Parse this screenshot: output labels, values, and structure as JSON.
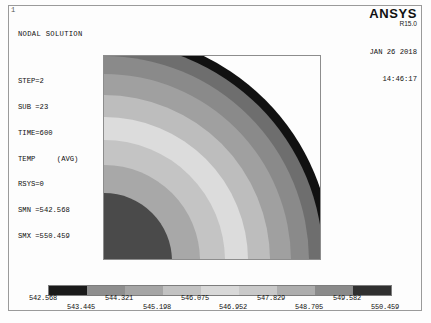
{
  "window": {
    "index_label": "1"
  },
  "header": {
    "title": "NODAL SOLUTION",
    "lines": [
      "STEP=2",
      "SUB =23",
      "TIME=600",
      "TEMP     (AVG)",
      "RSYS=0",
      "SMN =542.568",
      "SMX =550.459"
    ],
    "step": "STEP=2",
    "sub": "SUB =23",
    "time": "TIME=600",
    "quantity": "TEMP     (AVG)",
    "rsys": "RSYS=0",
    "smn": "SMN =542.568",
    "smx": "SMX =550.459"
  },
  "brand": {
    "name": "ANSYS",
    "release": "R15.0"
  },
  "timestamp": {
    "date": "JAN 26 2018",
    "time": "14:46:17"
  },
  "plot": {
    "min_marker": "MN",
    "max_marker": "MX"
  },
  "chart_data": {
    "type": "heatmap",
    "title": "NODAL SOLUTION",
    "quantity": "TEMP (AVG)",
    "units_note": "",
    "xlabel": "",
    "ylabel": "",
    "smn": 542.568,
    "smx": 550.459,
    "band_count": 9,
    "tick_labels": [
      "542.568",
      "543.445",
      "544.321",
      "545.198",
      "546.075",
      "546.952",
      "547.829",
      "548.705",
      "549.582",
      "550.459"
    ],
    "tick_values": [
      542.568,
      543.445,
      544.321,
      545.198,
      546.075,
      546.952,
      547.829,
      548.705,
      549.582,
      550.459
    ],
    "band_ranges": [
      [
        542.568,
        543.445
      ],
      [
        543.445,
        544.321
      ],
      [
        544.321,
        545.198
      ],
      [
        545.198,
        546.075
      ],
      [
        546.075,
        546.952
      ],
      [
        546.952,
        547.829
      ],
      [
        547.829,
        548.705
      ],
      [
        548.705,
        549.582
      ],
      [
        549.582,
        550.459
      ]
    ],
    "band_colors": [
      "#1a1a1a",
      "#8e8e8e",
      "#a5a5a5",
      "#c2c2c2",
      "#d8d8d8",
      "#c9c9c9",
      "#adadad",
      "#8a8a8a",
      "#303030"
    ],
    "legend_position": "bottom",
    "grid": false,
    "geometry": "quarter-annulus, concentric bands centred at lower-left origin",
    "radial_bands": [
      {
        "index": 0,
        "value_range": [
          542.568,
          543.445
        ],
        "color": "#4a4a4a",
        "outer_radius_pct": 30
      },
      {
        "index": 1,
        "value_range": [
          543.445,
          544.321
        ],
        "color": "#a8a8a8",
        "outer_radius_pct": 42
      },
      {
        "index": 2,
        "value_range": [
          544.321,
          545.198
        ],
        "color": "#c4c4c4",
        "outer_radius_pct": 53
      },
      {
        "index": 3,
        "value_range": [
          545.198,
          546.075
        ],
        "color": "#dcdcdc",
        "outer_radius_pct": 63
      },
      {
        "index": 4,
        "value_range": [
          546.075,
          546.952
        ],
        "color": "#bdbdbd",
        "outer_radius_pct": 73
      },
      {
        "index": 5,
        "value_range": [
          546.952,
          547.829
        ],
        "color": "#a0a0a0",
        "outer_radius_pct": 82
      },
      {
        "index": 6,
        "value_range": [
          547.829,
          548.705
        ],
        "color": "#8a8a8a",
        "outer_radius_pct": 90
      },
      {
        "index": 7,
        "value_range": [
          548.705,
          549.582
        ],
        "color": "#6e6e6e",
        "outer_radius_pct": 96
      },
      {
        "index": 8,
        "value_range": [
          549.582,
          550.459
        ],
        "color": "#111111",
        "outer_radius_pct": 100
      }
    ]
  },
  "colors": {
    "background": "#fdfdfd",
    "frame": "#9a9a9a",
    "text": "#101010"
  }
}
